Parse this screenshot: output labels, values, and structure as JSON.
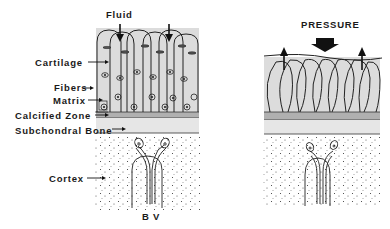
{
  "left_panel": {
    "title": "Fluid",
    "labels": {
      "cartilage": "Cartilage",
      "fibers": "Fibers",
      "matrix": "Matrix",
      "calcified_zone": "Calcified Zone",
      "subchondral_bone": "Subchondral Bone",
      "cortex": "Cortex",
      "blood_vessel": "B V"
    }
  },
  "right_panel": {
    "title": "PRESSURE"
  },
  "colors": {
    "cartilage": "#dcdcdc",
    "calcified_zone": "#b0b0b0",
    "subchondral_bone": "#e6e6e6",
    "ink": "#1a1a1a"
  }
}
